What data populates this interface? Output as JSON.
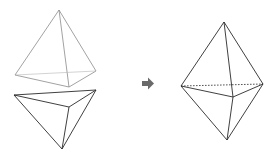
{
  "diagram": {
    "title": "",
    "colors": {
      "background": "#ffffff",
      "top_tetra_stroke": "#8a8a8a",
      "bottom_tetra_stroke": "#2a2a2a",
      "result_stroke": "#2a2a2a",
      "arrow": "#6a6a6a"
    },
    "shapes": [
      {
        "id": "top-tetrahedron",
        "vertices": {
          "apex": [
            59,
            10
          ],
          "left": [
            15,
            75
          ],
          "right": [
            96,
            71
          ],
          "front": [
            69,
            87
          ]
        }
      },
      {
        "id": "bottom-tetrahedron",
        "vertices": {
          "left": [
            14,
            95
          ],
          "right": [
            96,
            90
          ],
          "front": [
            69,
            107
          ],
          "bottom": [
            62,
            149
          ]
        }
      },
      {
        "id": "bipyramid",
        "vertices": {
          "apex": [
            224,
            22
          ],
          "left": [
            181,
            86
          ],
          "right": [
            263,
            84
          ],
          "front": [
            233,
            97
          ],
          "bottom": [
            227,
            140
          ]
        },
        "hidden_edge": "left-right dashed"
      }
    ],
    "arrow": {
      "direction": "right",
      "icon": "arrow-right-icon"
    }
  }
}
